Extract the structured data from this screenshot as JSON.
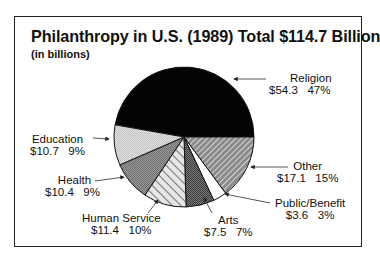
{
  "chart_data": {
    "type": "pie",
    "title": "Philanthropy in U.S. (1989) Total $114.7 Billion",
    "subtitle": "(in billions)",
    "total": 114.7,
    "units": "billions of dollars",
    "categories": [
      "Religion",
      "Other",
      "Public/Benefit",
      "Arts",
      "Human Service",
      "Health",
      "Education"
    ],
    "values": [
      54.3,
      17.1,
      3.6,
      7.5,
      11.4,
      10.4,
      10.7
    ],
    "percentages": [
      47,
      15,
      3,
      7,
      10,
      9,
      9
    ],
    "slices": [
      {
        "label": "Religion",
        "value": 54.3,
        "value_text": "$54.3",
        "percent": 47,
        "percent_text": "47%",
        "fill": "solid-black"
      },
      {
        "label": "Other",
        "value": 17.1,
        "value_text": "$17.1",
        "percent": 15,
        "percent_text": "15%",
        "fill": "dark-diagonal-hatch"
      },
      {
        "label": "Public/Benefit",
        "value": 3.6,
        "value_text": "$3.6",
        "percent": 3,
        "percent_text": "3%",
        "fill": "white"
      },
      {
        "label": "Arts",
        "value": 7.5,
        "value_text": "$7.5",
        "percent": 7,
        "percent_text": "7%",
        "fill": "dark-checker"
      },
      {
        "label": "Human Service",
        "value": 11.4,
        "value_text": "$11.4",
        "percent": 10,
        "percent_text": "10%",
        "fill": "light-diagonal-stripes"
      },
      {
        "label": "Health",
        "value": 10.4,
        "value_text": "$10.4",
        "percent": 9,
        "percent_text": "9%",
        "fill": "medium-gray-dots"
      },
      {
        "label": "Education",
        "value": 10.7,
        "value_text": "$10.7",
        "percent": 9,
        "percent_text": "9%",
        "fill": "light-gray-dots"
      }
    ],
    "legend": "none (callout labels with arrows)",
    "grid": false
  },
  "labels": {
    "religion": {
      "name": "Religion",
      "stats": "$54.3   47%"
    },
    "other": {
      "name": "Other",
      "stats": "$17.1   15%"
    },
    "public_benefit": {
      "name": "Public/Benefit",
      "stats": "$3.6   3%"
    },
    "arts": {
      "name": "Arts",
      "stats": "$7.5   7%"
    },
    "human_service": {
      "name": "Human Service",
      "stats": "$11.4   10%"
    },
    "health": {
      "name": "Health",
      "stats": "$10.4   9%"
    },
    "education": {
      "name": "Education",
      "stats": "$10.7   9%"
    }
  }
}
